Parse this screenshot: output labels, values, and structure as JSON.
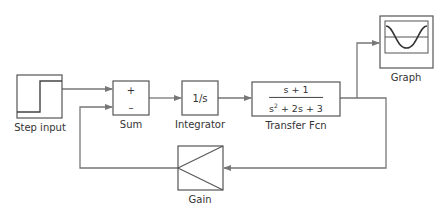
{
  "diagram": {
    "type": "block-diagram",
    "colors": {
      "stroke": "#555555",
      "signal": "#777777",
      "text": "#333333",
      "background": "#ffffff"
    },
    "blocks": [
      {
        "id": "step",
        "label": "Step input",
        "icon": "step-signal-icon"
      },
      {
        "id": "sum",
        "label": "Sum",
        "ports": [
          "+",
          "–"
        ]
      },
      {
        "id": "integrator",
        "label": "Integrator",
        "content": "1/s"
      },
      {
        "id": "tf",
        "label": "Transfer Fcn",
        "numerator": "s + 1",
        "denominator_prefix": "s",
        "denominator_exp": "2",
        "denominator_rest": " + 2s + 3"
      },
      {
        "id": "graph",
        "label": "Graph",
        "icon": "scope-wave-icon"
      },
      {
        "id": "gain",
        "label": "Gain",
        "icon": "gain-triangle-icon"
      }
    ],
    "connections": [
      {
        "from": "step",
        "to": "sum",
        "port": "+"
      },
      {
        "from": "sum",
        "to": "integrator"
      },
      {
        "from": "integrator",
        "to": "tf"
      },
      {
        "from": "tf",
        "to": "graph"
      },
      {
        "from": "tf",
        "to": "gain",
        "note": "feedback"
      },
      {
        "from": "gain",
        "to": "sum",
        "port": "–"
      }
    ]
  }
}
